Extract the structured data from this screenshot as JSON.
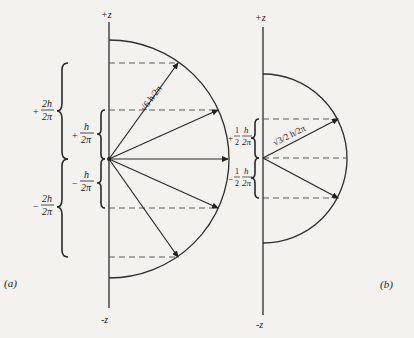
{
  "panel_a": {
    "label": "(a)",
    "axis_top": "+z",
    "axis_bottom": "-z",
    "magnitude_label": "√6 h/2π",
    "z_components": [
      {
        "sign": "+",
        "num": "2h",
        "den": "2π"
      },
      {
        "sign": "+",
        "num": "h",
        "den": "2π"
      },
      {
        "sign": "−",
        "num": "h",
        "den": "2π"
      },
      {
        "sign": "−",
        "num": "2h",
        "den": "2π"
      }
    ]
  },
  "panel_b": {
    "label": "(b)",
    "axis_top": "+z",
    "axis_bottom": "-z",
    "magnitude_label": "√3/2 h/2π",
    "z_components": [
      {
        "sign": "+",
        "coef": "1/2",
        "num": "h",
        "den": "2π"
      },
      {
        "sign": "−",
        "coef": "1/2",
        "num": "h",
        "den": "2π"
      }
    ]
  }
}
